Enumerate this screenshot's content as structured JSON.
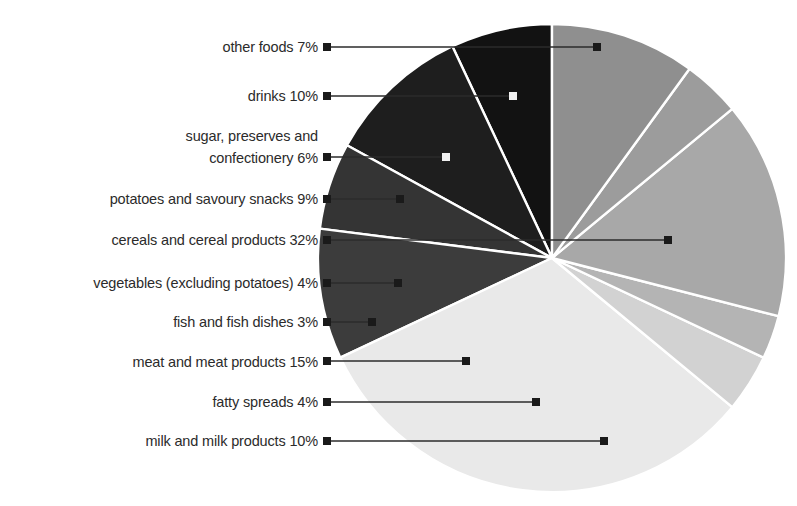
{
  "chart": {
    "type": "pie",
    "title": "",
    "geometry": {
      "cx": 552,
      "cy": 258,
      "r": 234,
      "start_angle_deg": -90,
      "direction": "counter-clockwise"
    },
    "style": {
      "background": "#ffffff",
      "slice_border": "#ffffff",
      "leader_line_color": "#2b2b2b",
      "label_color": "#2b2b2b"
    }
  },
  "chart_data": {
    "type": "pie",
    "title": "",
    "xlabel": "",
    "ylabel": "",
    "unit": "%",
    "total": 100,
    "legend_position": "left-callouts",
    "grid": false,
    "categories": [
      "other foods",
      "drinks",
      "sugar, preserves and confectionery",
      "potatoes and savoury snacks",
      "cereals and cereal products",
      "vegetables (excluding potatoes)",
      "fish and fish dishes",
      "meat and meat products",
      "fatty spreads",
      "milk and milk products"
    ],
    "values": [
      7,
      10,
      6,
      9,
      32,
      4,
      3,
      15,
      4,
      10
    ],
    "colors": [
      "#121212",
      "#1e1e1e",
      "#343434",
      "#3c3c3c",
      "#e9e9e9",
      "#d2d2d2",
      "#b4b4b4",
      "#a8a8a8",
      "#9c9c9c",
      "#8f8f8f"
    ]
  },
  "callouts": [
    {
      "label": "other foods 7%",
      "value": 7,
      "text_x": 318,
      "text_y": 52,
      "line_x1": 327,
      "line_x2": 597,
      "line_y": 47,
      "dot_color": "#1a1a1a"
    },
    {
      "label": "drinks 10%",
      "value": 10,
      "text_x": 318,
      "text_y": 101,
      "line_x1": 327,
      "line_x2": 513,
      "line_y": 96,
      "dot_color": "#f0f0f0"
    },
    {
      "label": "sugar, preserves and",
      "value": 6,
      "text_x": 318,
      "text_y": 141,
      "line_x1": 0,
      "line_x2": 0,
      "line_y": 0,
      "dot_color": ""
    },
    {
      "label": "confectionery 6%",
      "value": 6,
      "text_x": 318,
      "text_y": 163,
      "line_x1": 327,
      "line_x2": 446,
      "line_y": 157,
      "dot_color": "#f0f0f0"
    },
    {
      "label": "potatoes and savoury snacks 9%",
      "value": 9,
      "text_x": 318,
      "text_y": 204,
      "line_x1": 327,
      "line_x2": 400,
      "line_y": 199,
      "dot_color": "#1a1a1a"
    },
    {
      "label": "cereals and cereal products 32%",
      "value": 32,
      "text_x": 318,
      "text_y": 245,
      "line_x1": 327,
      "line_x2": 668,
      "line_y": 240,
      "dot_color": "#1a1a1a"
    },
    {
      "label": "vegetables (excluding potatoes) 4%",
      "value": 4,
      "text_x": 318,
      "text_y": 288,
      "line_x1": 327,
      "line_x2": 398,
      "line_y": 283,
      "dot_color": "#1a1a1a"
    },
    {
      "label": "fish and fish dishes 3%",
      "value": 3,
      "text_x": 318,
      "text_y": 327,
      "line_x1": 327,
      "line_x2": 372,
      "line_y": 322,
      "dot_color": "#1a1a1a"
    },
    {
      "label": "meat and meat products 15%",
      "value": 15,
      "text_x": 318,
      "text_y": 367,
      "line_x1": 327,
      "line_x2": 466,
      "line_y": 361,
      "dot_color": "#1a1a1a"
    },
    {
      "label": "fatty spreads 4%",
      "value": 4,
      "text_x": 318,
      "text_y": 407,
      "line_x1": 327,
      "line_x2": 536,
      "line_y": 402,
      "dot_color": "#1a1a1a"
    },
    {
      "label": "milk and milk products 10%",
      "value": 10,
      "text_x": 318,
      "text_y": 446,
      "line_x1": 327,
      "line_x2": 604,
      "line_y": 441,
      "dot_color": "#1a1a1a"
    }
  ]
}
